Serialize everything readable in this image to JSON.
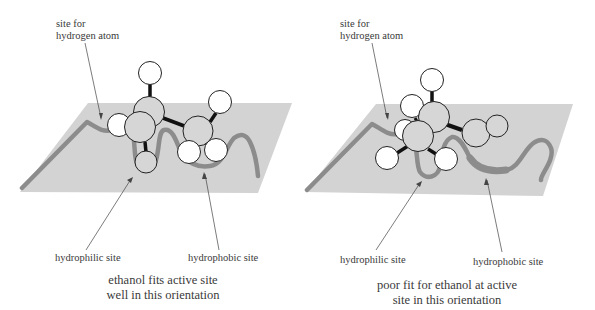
{
  "figure": {
    "colors": {
      "plane": "#d3d3d3",
      "site_curve": "#8c8c8c",
      "carbon_fill": "#d6d6d6",
      "hydrogen_fill": "#ffffff",
      "oxygen_fill": "#d6d6d6",
      "atom_outline": "#222222",
      "bond": "#111111",
      "leader_line": "#444444",
      "text": "#3a3a3a"
    },
    "panels": [
      {
        "id": "good-fit",
        "labels": {
          "hydrogen_site_line1": "site for",
          "hydrogen_site_line2": "hydrogen atom",
          "hydrophilic": "hydrophilic site",
          "hydrophobic": "hydrophobic site"
        },
        "caption_line1": "ethanol fits active site",
        "caption_line2": "well in this orientation"
      },
      {
        "id": "poor-fit",
        "labels": {
          "hydrogen_site_line1": "site for",
          "hydrogen_site_line2": "hydrogen atom",
          "hydrophilic": "hydrophilic site",
          "hydrophobic": "hydrophobic site"
        },
        "caption_line1": "poor fit for ethanol at active",
        "caption_line2": "site in this orientation"
      }
    ]
  }
}
